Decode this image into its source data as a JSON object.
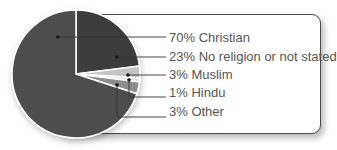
{
  "chart_data": {
    "type": "pie",
    "title": "",
    "start_angle_deg": 0,
    "direction": "clockwise",
    "slices": [
      {
        "label": "No religion or not stated",
        "value": 23,
        "display": "23% No religion or not stated",
        "color": "#3c3c3c"
      },
      {
        "label": "Muslim",
        "value": 3,
        "display": "3% Muslim",
        "color": "#c4c4c4"
      },
      {
        "label": "Hindu",
        "value": 1,
        "display": "1% Hindu",
        "color": "#e2e2e2"
      },
      {
        "label": "Other",
        "value": 3,
        "display": "3% Other",
        "color": "#8e8e8e"
      },
      {
        "label": "Christian",
        "value": 70,
        "display": "70% Christian",
        "color": "#4e4e4e"
      }
    ],
    "legend_order": [
      "70% Christian",
      "23% No religion or not stated",
      "3% Muslim",
      "1% Hindu",
      "3% Other"
    ]
  },
  "labels": {
    "christian": "70% Christian",
    "no_religion": "23% No religion or not stated",
    "muslim": "3% Muslim",
    "hindu": "1% Hindu",
    "other": "3% Other"
  }
}
